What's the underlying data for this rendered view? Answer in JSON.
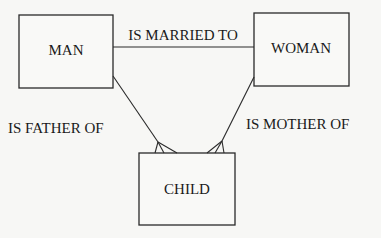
{
  "diagram": {
    "type": "entity-relationship",
    "entities": [
      {
        "id": "man",
        "label": "MAN"
      },
      {
        "id": "woman",
        "label": "WOMAN"
      },
      {
        "id": "child",
        "label": "CHILD"
      }
    ],
    "relationships": [
      {
        "from": "man",
        "to": "woman",
        "label": "IS MARRIED TO",
        "cardinality": "one-to-one"
      },
      {
        "from": "man",
        "to": "child",
        "label": "IS FATHER OF",
        "cardinality": "one-to-many"
      },
      {
        "from": "woman",
        "to": "child",
        "label": "IS MOTHER OF",
        "cardinality": "one-to-many"
      }
    ],
    "colors": {
      "stroke": "#2a2a2a",
      "text": "#1a1a1a",
      "background": "#f7f7f5"
    }
  }
}
